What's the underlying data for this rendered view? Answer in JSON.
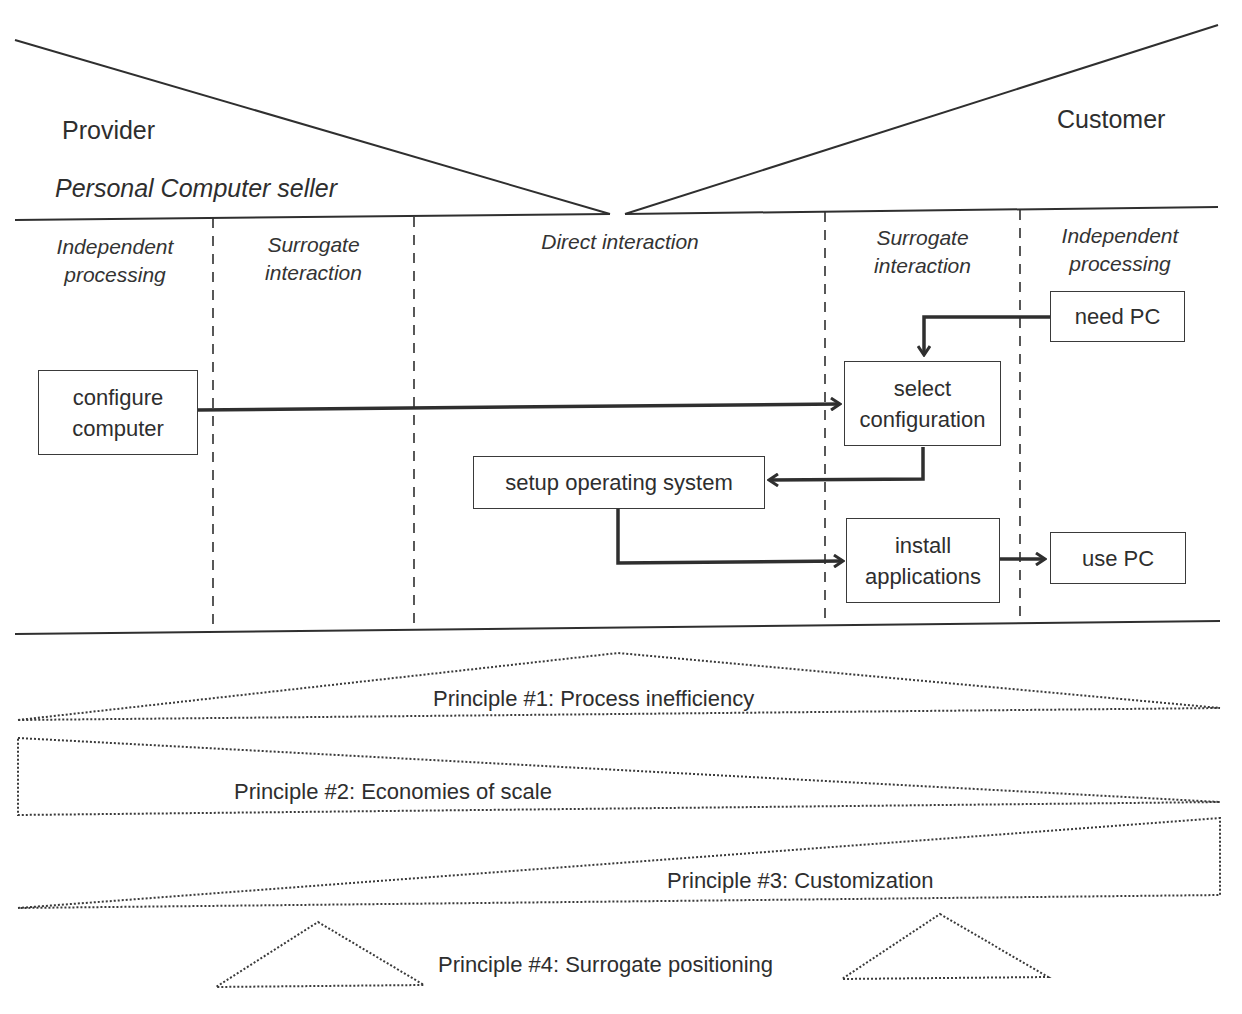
{
  "header": {
    "provider_label": "Provider",
    "provider_subtitle": "Personal Computer seller",
    "customer_label": "Customer"
  },
  "regions": [
    {
      "id": "provider-independent",
      "line1": "Independent",
      "line2": "processing"
    },
    {
      "id": "provider-surrogate",
      "line1": "Surrogate",
      "line2": "interaction"
    },
    {
      "id": "direct",
      "line1": "Direct interaction",
      "line2": ""
    },
    {
      "id": "customer-surrogate",
      "line1": "Surrogate",
      "line2": "interaction"
    },
    {
      "id": "customer-independent",
      "line1": "Independent",
      "line2": "processing"
    }
  ],
  "steps": {
    "configure_computer": {
      "line1": "configure",
      "line2": "computer"
    },
    "need_pc": {
      "line1": "need PC"
    },
    "select_configuration": {
      "line1": "select",
      "line2": "configuration"
    },
    "setup_os": {
      "line1": "setup operating system"
    },
    "install_applications": {
      "line1": "install",
      "line2": "applications"
    },
    "use_pc": {
      "line1": "use PC"
    }
  },
  "flows": [
    {
      "from": "need PC",
      "to": "select configuration"
    },
    {
      "from": "configure computer",
      "to": "select configuration"
    },
    {
      "from": "select configuration",
      "to": "setup operating system"
    },
    {
      "from": "setup operating system",
      "to": "install applications"
    },
    {
      "from": "install applications",
      "to": "use PC"
    }
  ],
  "principles": [
    {
      "label": "Principle #1: Process inefficiency"
    },
    {
      "label": "Principle #2: Economies of scale"
    },
    {
      "label": "Principle #3: Customization"
    },
    {
      "label": "Principle #4: Surrogate positioning"
    }
  ],
  "colors": {
    "line": "#2f2f2f",
    "text": "#2e2e2e",
    "background": "#ffffff"
  }
}
